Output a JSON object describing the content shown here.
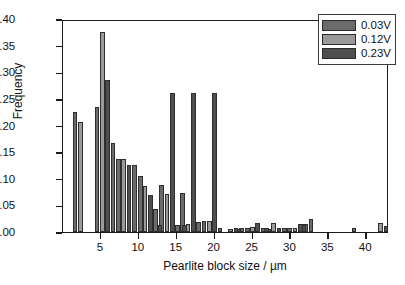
{
  "chart_data": {
    "type": "bar",
    "title": "",
    "xlabel": "Pearlite block size / µm",
    "ylabel": "Frequency",
    "xlim": [
      0,
      43
    ],
    "ylim": [
      0.0,
      0.4
    ],
    "xticks": [
      5,
      10,
      15,
      20,
      25,
      30,
      35,
      40
    ],
    "xtick_labels": [
      "5",
      "10",
      "15",
      "20",
      "25",
      "30",
      "35",
      "40"
    ],
    "yticks": [
      0.0,
      0.05,
      0.1,
      0.15,
      0.2,
      0.25,
      0.3,
      0.35,
      0.4
    ],
    "ytick_labels": [
      "0.00",
      "0.05",
      "0.10",
      "0.15",
      "0.20",
      "0.25",
      "0.30",
      "0.35",
      "0.40"
    ],
    "grid": false,
    "legend_position": "top-right",
    "bar_width": 0.62,
    "series": [
      {
        "name": "0.03V",
        "color": "#6b6b6b",
        "x": [
          1.6,
          4.5,
          7.3,
          10.2,
          13.0,
          15.8,
          18.6,
          21.4,
          24.3,
          27.1,
          29.9,
          32.7,
          35.5,
          38.4,
          41.2
        ],
        "values": [
          0.225,
          0.235,
          0.138,
          0.105,
          0.089,
          0.073,
          0.02,
          0.0,
          0.007,
          0.006,
          0.007,
          0.024,
          0.0,
          0.008,
          0.0
        ]
      },
      {
        "name": "0.12V",
        "color": "#9a9a9a",
        "x": [
          2.3,
          5.2,
          8.0,
          10.8,
          13.7,
          16.5,
          19.3,
          22.1,
          25.0,
          27.8,
          30.6,
          33.4,
          36.3,
          39.1,
          41.9
        ],
        "values": [
          0.207,
          0.375,
          0.138,
          0.086,
          0.071,
          0.015,
          0.021,
          0.006,
          0.01,
          0.017,
          0.007,
          0.0,
          0.0,
          0.0,
          0.017
        ]
      },
      {
        "name": "0.23V",
        "color": "#4f4f4f",
        "x": [
          3.0,
          5.9,
          8.7,
          11.5,
          14.4,
          17.2,
          20.0,
          22.8,
          25.7,
          28.5,
          31.3,
          34.1,
          37.0,
          39.8,
          42.6
        ],
        "values": [
          0.0,
          0.286,
          0.126,
          0.07,
          0.261,
          0.261,
          0.261,
          0.007,
          0.016,
          0.007,
          0.015,
          0.0,
          0.0,
          0.0,
          0.012
        ]
      },
      {
        "name": "extra-0.03V",
        "color": "#6b6b6b",
        "x": [
          6.6,
          9.4,
          12.2,
          15.1,
          17.9,
          20.7,
          23.5,
          26.4,
          29.2,
          32.0,
          40.5
        ],
        "values": [
          0.167,
          0.126,
          0.043,
          0.014,
          0.018,
          0.007,
          0.007,
          0.007,
          0.007,
          0.015,
          0.0
        ]
      },
      {
        "name": "extra-0.23V",
        "color": "#4f4f4f",
        "x": [
          12.8,
          16.0,
          23.2,
          26.8,
          31.8
        ],
        "values": [
          0.013,
          0.013,
          0.006,
          0.007,
          0.014
        ]
      }
    ]
  },
  "legend": {
    "items": [
      {
        "label": "0.03V",
        "color": "#6b6b6b"
      },
      {
        "label": "0.12V",
        "color": "#9a9a9a"
      },
      {
        "label": "0.23V",
        "color": "#4f4f4f"
      }
    ]
  }
}
